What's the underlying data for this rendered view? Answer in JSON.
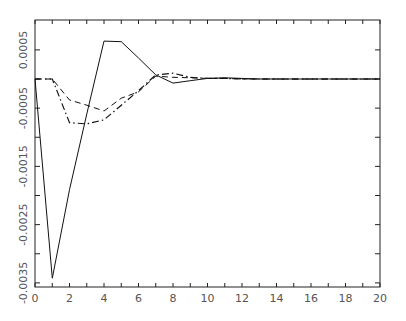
{
  "chart_data": {
    "type": "line",
    "title": "",
    "xlabel": "",
    "ylabel": "",
    "xlim": [
      0,
      20
    ],
    "ylim": [
      -0.0036,
      0.001
    ],
    "grid": false,
    "legend": null,
    "x_ticks": [
      "0",
      "2",
      "4",
      "6",
      "8",
      "10",
      "12",
      "14",
      "16",
      "18",
      "20"
    ],
    "y_ticks": [
      "0.0005",
      "-0.0005",
      "-0.0015",
      "-0.0025",
      "-0.0035"
    ],
    "x": [
      0,
      1,
      2,
      3,
      4,
      5,
      6,
      7,
      8,
      9,
      10,
      11,
      12,
      13,
      14,
      15,
      16,
      17,
      18,
      19,
      20
    ],
    "series": [
      {
        "name": "solid",
        "style": "solid",
        "values": [
          0,
          -0.00342,
          -0.0019,
          -0.0006,
          0.00065,
          0.00064,
          0.00036,
          7e-05,
          -7e-05,
          -3e-05,
          1e-05,
          2e-05,
          1e-05,
          0,
          0,
          0,
          0,
          0,
          0,
          0,
          0
        ]
      },
      {
        "name": "dashed",
        "style": "dashed",
        "values": [
          0,
          0,
          -0.00036,
          -0.00045,
          -0.00055,
          -0.00033,
          -0.00022,
          5e-05,
          3e-05,
          2e-05,
          1e-05,
          1e-05,
          0,
          0,
          0,
          0,
          0,
          0,
          0,
          0,
          0
        ]
      },
      {
        "name": "dash-dot",
        "style": "dashdot",
        "values": [
          0,
          0,
          -0.00075,
          -0.00077,
          -0.0007,
          -0.00045,
          -0.0002,
          7e-05,
          0.0001,
          3e-05,
          1e-05,
          1e-05,
          0,
          0,
          0,
          0,
          0,
          0,
          0,
          0,
          0
        ]
      }
    ]
  }
}
